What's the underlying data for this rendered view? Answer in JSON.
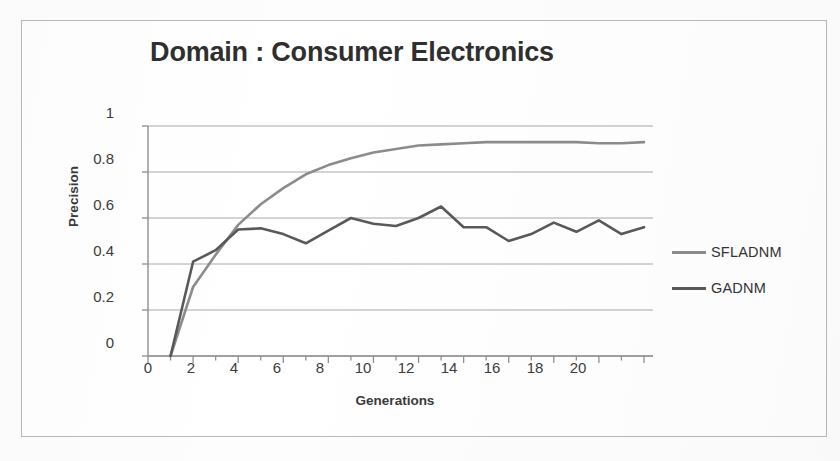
{
  "figure": {
    "border_color": "#b9b9b9",
    "background": "#ffffff"
  },
  "title": "Domain : Consumer Electronics",
  "axes": {
    "y_title": "Precision",
    "x_title": "Generations",
    "y_ticks": [
      "0",
      "0.2",
      "0.4",
      "0.6",
      "0.8",
      "1"
    ],
    "x_ticks": [
      "0",
      "2",
      "4",
      "6",
      "8",
      "10",
      "12",
      "14",
      "16",
      "18",
      "20"
    ]
  },
  "legend": {
    "position": "right",
    "items": [
      {
        "label": "SFLADNM",
        "color": "#8c8c8c"
      },
      {
        "label": "GADNM",
        "color": "#595959"
      }
    ]
  },
  "chart_data": {
    "type": "line",
    "title": "Domain : Consumer Electronics",
    "xlabel": "Generations",
    "ylabel": "Precision",
    "xlim": [
      0,
      22.4
    ],
    "ylim": [
      0,
      1
    ],
    "grid": true,
    "x_major_step": 2,
    "x_minor_step": 1,
    "y_major_step": 0.2,
    "x": [
      1,
      2,
      3,
      4,
      5,
      6,
      7,
      8,
      9,
      10,
      11,
      12,
      13,
      14,
      15,
      16,
      17,
      18,
      19,
      20,
      21,
      22
    ],
    "series": [
      {
        "name": "SFLADNM",
        "color": "#8c8c8c",
        "values": [
          0,
          0.3,
          0.44,
          0.57,
          0.66,
          0.73,
          0.79,
          0.83,
          0.86,
          0.885,
          0.9,
          0.915,
          0.92,
          0.925,
          0.93,
          0.93,
          0.93,
          0.93,
          0.93,
          0.925,
          0.925,
          0.93
        ]
      },
      {
        "name": "GADNM",
        "color": "#595959",
        "values": [
          0,
          0.41,
          0.46,
          0.55,
          0.555,
          0.53,
          0.49,
          0.545,
          0.6,
          0.575,
          0.565,
          0.6,
          0.65,
          0.56,
          0.56,
          0.5,
          0.53,
          0.58,
          0.54,
          0.59,
          0.53,
          0.56
        ]
      }
    ]
  }
}
